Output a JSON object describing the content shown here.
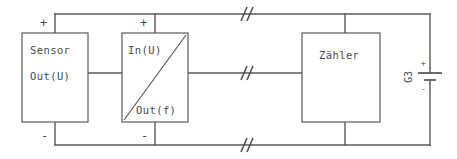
{
  "diagram": {
    "stroke_color": "#5a5a5a",
    "background_color": "#ffffff",
    "blocks": [
      {
        "id": "sensor",
        "label_top": "Sensor",
        "label_bottom": "Out(U)",
        "terminal_plus": "+",
        "terminal_minus": "-"
      },
      {
        "id": "converter",
        "label_top": "In(U)",
        "label_bottom": "Out(f)",
        "terminal_plus": "+",
        "terminal_minus": "-"
      },
      {
        "id": "counter",
        "label_top": "Zähler"
      }
    ],
    "source": {
      "designator": "G3",
      "terminal_plus": "+",
      "terminal_minus": "-"
    },
    "break_marks": {
      "glyph": "//",
      "count": 3,
      "note": "double slash wire-break symbol on supply, signal and return lines"
    }
  }
}
